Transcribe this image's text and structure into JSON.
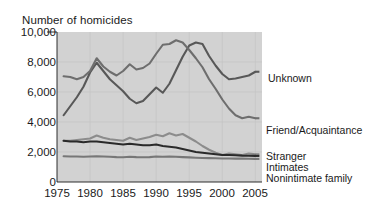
{
  "chart_data": {
    "type": "line",
    "title": "Number of homicides",
    "xlabel": "",
    "ylabel": "",
    "xlim": [
      1975,
      2006
    ],
    "ylim": [
      0,
      10000
    ],
    "xticks": [
      "1975",
      "1980",
      "1985",
      "1990",
      "1995",
      "2000",
      "2005"
    ],
    "yticks": [
      "0",
      "2,000",
      "4,000",
      "6,000",
      "8,000",
      "10,000"
    ],
    "grid": true,
    "legend_position": "right-inline",
    "plot_background": "#d2d2d2",
    "x": [
      1976,
      1977,
      1978,
      1979,
      1980,
      1981,
      1982,
      1983,
      1984,
      1985,
      1986,
      1987,
      1988,
      1989,
      1990,
      1991,
      1992,
      1993,
      1994,
      1995,
      1996,
      1997,
      1998,
      1999,
      2000,
      2001,
      2002,
      2003,
      2004,
      2005
    ],
    "series": [
      {
        "name": "Unknown",
        "label": "Unknown",
        "color": "#585858",
        "values": [
          4450,
          5050,
          5650,
          6350,
          7300,
          7950,
          7400,
          6850,
          6450,
          6050,
          5550,
          5250,
          5400,
          5850,
          6300,
          5950,
          6550,
          7450,
          8350,
          9100,
          9300,
          9200,
          8400,
          7750,
          7200,
          6850,
          6900,
          7000,
          7100,
          7350
        ]
      },
      {
        "name": "Friend/Acquaintance",
        "label": "Friend/Acquaintance",
        "color": "#6e6e6e",
        "values": [
          7050,
          7000,
          6850,
          7000,
          7400,
          8250,
          7700,
          7350,
          7100,
          7400,
          7850,
          7500,
          7600,
          7900,
          8550,
          9150,
          9200,
          9450,
          9300,
          8800,
          8250,
          7650,
          6850,
          6200,
          5500,
          4900,
          4450,
          4250,
          4350,
          4250
        ]
      },
      {
        "name": "Stranger",
        "label": "Stranger",
        "color": "#8c8c8c",
        "values": [
          2750,
          2750,
          2800,
          2850,
          2900,
          3100,
          2950,
          2850,
          2800,
          2750,
          2950,
          2800,
          2900,
          3000,
          3150,
          3050,
          3250,
          3100,
          3200,
          2950,
          2700,
          2400,
          2150,
          1950,
          1800,
          1900,
          1850,
          1800,
          1900,
          1850
        ]
      },
      {
        "name": "Intimates",
        "label": "Intimates",
        "color": "#2a2a2a",
        "values": [
          2750,
          2700,
          2700,
          2650,
          2700,
          2700,
          2650,
          2600,
          2550,
          2500,
          2550,
          2500,
          2450,
          2450,
          2500,
          2400,
          2350,
          2300,
          2200,
          2100,
          2000,
          1950,
          1900,
          1850,
          1800,
          1800,
          1780,
          1760,
          1750,
          1740
        ]
      },
      {
        "name": "Nonintimate family",
        "label": "Nonintimate family",
        "color": "#777777",
        "values": [
          1720,
          1700,
          1700,
          1680,
          1700,
          1720,
          1700,
          1680,
          1660,
          1650,
          1680,
          1660,
          1650,
          1660,
          1700,
          1680,
          1700,
          1680,
          1660,
          1640,
          1620,
          1600,
          1590,
          1580,
          1570,
          1570,
          1560,
          1560,
          1550,
          1540
        ]
      }
    ]
  },
  "labels": {
    "unknown": "Unknown",
    "friend_acquaintance": "Friend/Acquaintance",
    "stranger": "Stranger",
    "intimates": "Intimates",
    "nonintimate_family": "Nonintimate family"
  }
}
